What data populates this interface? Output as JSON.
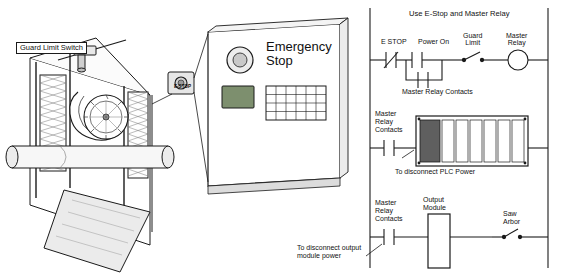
{
  "figure": {
    "left_panel": {
      "name": "saw-guard-emergency-stop-pictorial",
      "labels": [
        {
          "id": "guard-limit-switch",
          "text": "Guard Limit Switch",
          "x": 16,
          "y": 42
        },
        {
          "id": "e-stop-button",
          "text": "E-STOP",
          "x": 182,
          "y": 84
        },
        {
          "id": "emergency-stop-enclosure",
          "text": "Emergency\nStop",
          "x": 268,
          "y": 40
        }
      ]
    },
    "right_panel": {
      "name": "ladder-logic-diagram",
      "title": "Use E-Stop and Master Relay",
      "rung1": {
        "labels": [
          {
            "id": "e-stop",
            "text": "E STOP",
            "x": 386,
            "y": 39
          },
          {
            "id": "power-on",
            "text": "Power On",
            "x": 428,
            "y": 39
          },
          {
            "id": "guard-limit",
            "text": "Guard\nLimit",
            "x": 474,
            "y": 34
          },
          {
            "id": "master-relay",
            "text": "Master\nRelay",
            "x": 518,
            "y": 34
          }
        ]
      },
      "rung2": {
        "labels": [
          {
            "id": "master-relay-contacts",
            "text": "Master Relay Contacts",
            "x": 418,
            "y": 88
          },
          {
            "id": "master-relay-contacts-2",
            "text": "Master\nRelay\nContacts",
            "x": 380,
            "y": 112
          },
          {
            "id": "to-disconnect-plc-power",
            "text": "To disconnect PLC Power",
            "x": 412,
            "y": 171
          }
        ]
      },
      "rung3": {
        "labels": [
          {
            "id": "master-relay-contacts-3",
            "text": "Master\nRelay\nContacts",
            "x": 380,
            "y": 197
          },
          {
            "id": "output-module",
            "text": "Output\nModule",
            "x": 428,
            "y": 197
          },
          {
            "id": "saw-arbor",
            "text": "Saw\nArbor",
            "x": 505,
            "y": 211
          },
          {
            "id": "to-disconnect-output-module-power",
            "text": "To disconnect output\nmodule power",
            "x": 300,
            "y": 246
          }
        ]
      }
    }
  },
  "colors": {
    "line": "#1a1a1a",
    "fill_light": "#f2f2f2",
    "fill_mid": "#d9d9d9",
    "fill_dark": "#9a9a9a",
    "display_green": "#7d8f6e",
    "background": "#ffffff"
  }
}
